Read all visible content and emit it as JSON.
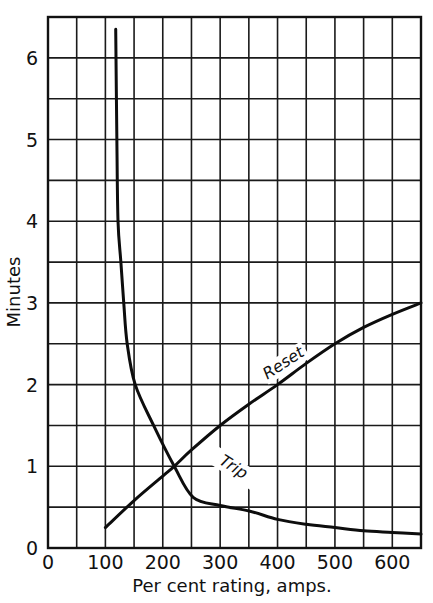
{
  "chart_data": {
    "type": "line",
    "title": "",
    "xlabel": "Per cent rating, amps.",
    "ylabel": "Minutes",
    "xlim": [
      0,
      650
    ],
    "ylim": [
      0,
      6.5
    ],
    "x_ticks": [
      0,
      100,
      200,
      300,
      400,
      500,
      600
    ],
    "y_ticks": [
      0,
      1,
      2,
      3,
      4,
      5,
      6
    ],
    "x_grid_step": 50,
    "y_grid_step": 0.5,
    "grid": true,
    "legend": "none (curves labeled inline)",
    "series": [
      {
        "name": "Trip",
        "label": "Trip",
        "points": [
          [
            118,
            6.35
          ],
          [
            120,
            5.0
          ],
          [
            122,
            4.0
          ],
          [
            127,
            3.5
          ],
          [
            132,
            3.0
          ],
          [
            138,
            2.5
          ],
          [
            152,
            2.0
          ],
          [
            184,
            1.5
          ],
          [
            220,
            1.0
          ],
          [
            253,
            0.62
          ],
          [
            300,
            0.52
          ],
          [
            352,
            0.45
          ],
          [
            400,
            0.35
          ],
          [
            450,
            0.29
          ],
          [
            500,
            0.25
          ],
          [
            550,
            0.21
          ],
          [
            600,
            0.19
          ],
          [
            650,
            0.17
          ]
        ]
      },
      {
        "name": "Reset",
        "label": "Reset",
        "points": [
          [
            100,
            0.25
          ],
          [
            150,
            0.58
          ],
          [
            200,
            0.88
          ],
          [
            220,
            1.0
          ],
          [
            250,
            1.2
          ],
          [
            300,
            1.5
          ],
          [
            350,
            1.76
          ],
          [
            400,
            2.0
          ],
          [
            450,
            2.26
          ],
          [
            500,
            2.5
          ],
          [
            550,
            2.7
          ],
          [
            600,
            2.86
          ],
          [
            650,
            3.0
          ]
        ]
      }
    ]
  }
}
